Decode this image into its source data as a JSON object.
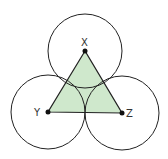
{
  "diagram": {
    "type": "geometry",
    "colors": {
      "fill": "#cfe8cc",
      "stroke": "#222222",
      "point": "#111111"
    },
    "points": [
      {
        "name": "X",
        "label": "X",
        "cx": 85,
        "cy": 51
      },
      {
        "name": "Y",
        "label": "Y",
        "cx": 48,
        "cy": 112
      },
      {
        "name": "Z",
        "label": "Z",
        "cx": 122,
        "cy": 113
      }
    ],
    "circles": [
      {
        "center": "X",
        "r": 37
      },
      {
        "center": "Y",
        "r": 37
      },
      {
        "center": "Z",
        "r": 37
      }
    ]
  }
}
